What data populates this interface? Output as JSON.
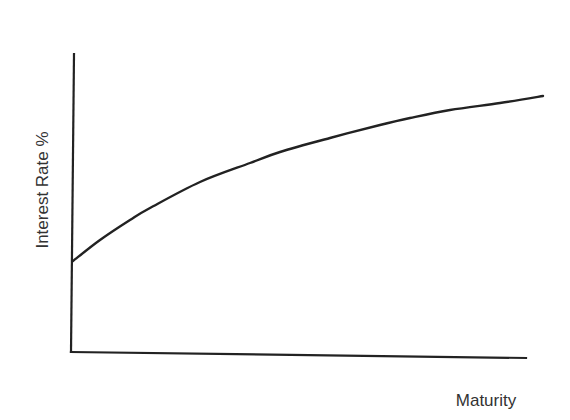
{
  "chart_data": {
    "type": "line",
    "title": "",
    "xlabel": "Maturity",
    "ylabel": "Interest Rate %",
    "grid": false,
    "legend": null,
    "x_ticks": [],
    "y_ticks": [],
    "series": [
      {
        "name": "Yield curve",
        "points_px": [
          [
            73,
            261
          ],
          [
            100,
            240
          ],
          [
            130,
            220
          ],
          [
            150,
            208
          ],
          [
            200,
            182
          ],
          [
            250,
            163
          ],
          [
            280,
            152
          ],
          [
            330,
            138
          ],
          [
            380,
            125
          ],
          [
            410,
            118
          ],
          [
            450,
            110
          ],
          [
            500,
            103
          ],
          [
            543,
            96
          ]
        ]
      }
    ],
    "axes_px": {
      "origin": [
        71,
        352
      ],
      "y_top": [
        74,
        54
      ],
      "x_end": [
        526,
        358
      ]
    },
    "colors": {
      "line": "#222222",
      "text": "#333333",
      "background": "#ffffff"
    }
  }
}
